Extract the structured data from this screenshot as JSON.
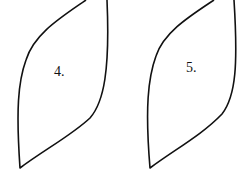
{
  "figures": [
    {
      "label": "4.",
      "stroke": "#111111"
    },
    {
      "label": "5.",
      "stroke": "#111111"
    }
  ]
}
